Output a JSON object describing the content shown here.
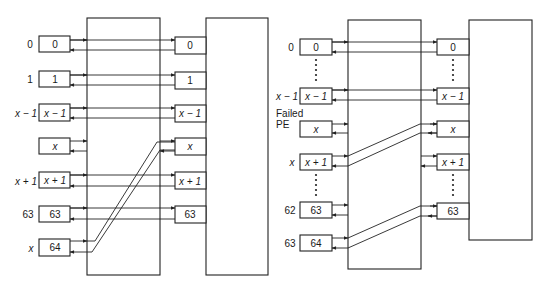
{
  "colors": {
    "line": "#222222",
    "background": "#ffffff"
  },
  "left_diagram": {
    "rows": [
      {
        "outer_label": "0",
        "pe_label": "0",
        "port_label": "0",
        "y": 44
      },
      {
        "outer_label": "1",
        "pe_label": "1",
        "port_label": "1",
        "y": 79
      },
      {
        "outer_label": "x − 1",
        "pe_label": "x − 1",
        "port_label": "x − 1",
        "y": 112
      },
      {
        "outer_label": "",
        "pe_label": "x",
        "port_label": "x",
        "y": 146
      },
      {
        "outer_label": "x + 1",
        "pe_label": "x + 1",
        "port_label": "x + 1",
        "y": 180
      },
      {
        "outer_label": "63",
        "pe_label": "63",
        "port_label": "63",
        "y": 214
      },
      {
        "outer_label": "x",
        "pe_label": "64",
        "port_label": "",
        "y": 247
      }
    ]
  },
  "right_diagram": {
    "failed_label_line1": "Failed",
    "failed_label_line2": "PE",
    "rows": [
      {
        "outer_label": "0",
        "pe_label": "0",
        "y": 47
      },
      {
        "outer_label": "x − 1",
        "pe_label": "x − 1",
        "y": 96
      },
      {
        "outer_label": "",
        "pe_label": "x",
        "y": 129
      },
      {
        "outer_label": "x",
        "pe_label": "x + 1",
        "y": 162
      },
      {
        "outer_label": "62",
        "pe_label": "63",
        "y": 210
      },
      {
        "outer_label": "63",
        "pe_label": "64",
        "y": 243
      }
    ],
    "ports": [
      {
        "label": "0",
        "y": 47
      },
      {
        "label": "x − 1",
        "y": 96
      },
      {
        "label": "x",
        "y": 129
      },
      {
        "label": "x + 1",
        "y": 162
      },
      {
        "label": "63",
        "y": 211
      }
    ]
  }
}
